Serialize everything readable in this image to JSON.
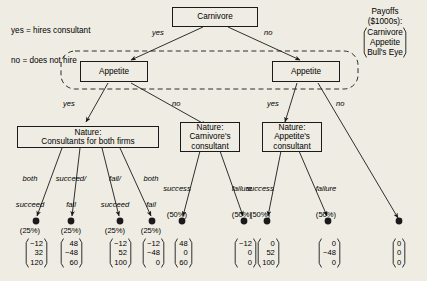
{
  "legend": {
    "line1": "yes = hires consultant",
    "line2": "no = does not hire"
  },
  "payoff_legend": {
    "title": "Payoffs",
    "units": "($1000s):",
    "players": [
      "Carnivore",
      "Appetite",
      "Bull's Eye"
    ]
  },
  "nodes": {
    "root": {
      "label": "Carnivore"
    },
    "appetite_left": {
      "label": "Appetite"
    },
    "appetite_right": {
      "label": "Appetite"
    },
    "nature_both": {
      "line1": "Nature:",
      "line2": "Consultants for both firms"
    },
    "nature_carnivore": {
      "line1": "Nature:",
      "line2": "Carnivore's",
      "line3": "consultant"
    },
    "nature_appetite": {
      "line1": "Nature:",
      "line2": "Appetite's",
      "line3": "consultant"
    }
  },
  "branches": {
    "root_yes": "yes",
    "root_no": "no",
    "appetite_left_yes": "yes",
    "appetite_left_no": "no",
    "appetite_right_yes": "yes",
    "appetite_right_no": "no",
    "nature_both_1": {
      "line1": "both",
      "line2": "succeed",
      "prob": "(25%)"
    },
    "nature_both_2": {
      "line1": "succeed/",
      "line2": "fail",
      "prob": "(25%)"
    },
    "nature_both_3": {
      "line1": "fail/",
      "line2": "succeed",
      "prob": "(25%)"
    },
    "nature_both_4": {
      "line1": "both",
      "line2": "fail",
      "prob": "(25%)"
    },
    "nature_carn_success": {
      "line1": "success",
      "prob": "(50%)"
    },
    "nature_carn_failure": {
      "line1": "failure",
      "prob": "(50%)"
    },
    "nature_app_success": {
      "line1": "success",
      "prob": "(50%)"
    },
    "nature_app_failure": {
      "line1": "failure",
      "prob": "(50%)"
    }
  },
  "payoffs": [
    {
      "id": "p1",
      "values": [
        "−12",
        "32",
        "120"
      ]
    },
    {
      "id": "p2",
      "values": [
        "48",
        "−48",
        "60"
      ]
    },
    {
      "id": "p3",
      "values": [
        "−12",
        "52",
        "100"
      ]
    },
    {
      "id": "p4",
      "values": [
        "−12",
        "−48",
        "0"
      ]
    },
    {
      "id": "p5",
      "values": [
        "48",
        "0",
        "60"
      ]
    },
    {
      "id": "p6",
      "values": [
        "−12",
        "0",
        "0"
      ]
    },
    {
      "id": "p7",
      "values": [
        "0",
        "52",
        "100"
      ]
    },
    {
      "id": "p8",
      "values": [
        "0",
        "−48",
        "0"
      ]
    },
    {
      "id": "p9",
      "values": [
        "0",
        "0",
        "0"
      ]
    }
  ],
  "colors": {
    "background": "#efece3",
    "ink": "#1a1a1a",
    "box_fill": "#efece3"
  }
}
